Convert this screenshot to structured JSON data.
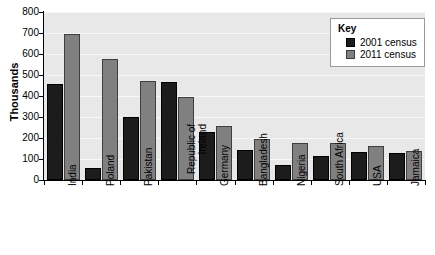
{
  "chart_data": {
    "type": "bar",
    "title": "",
    "xlabel": "",
    "ylabel": "Thousands",
    "ylim": [
      0,
      800
    ],
    "yticks": [
      0,
      100,
      200,
      300,
      400,
      500,
      600,
      700,
      800
    ],
    "grid": true,
    "legend_position": "top-right",
    "legend_title": "Key",
    "categories": [
      "India",
      "Poland",
      "Pakistan",
      "Republic of Ireland",
      "Germany",
      "Bangladesh",
      "Nigeria",
      "South Africa",
      "USA",
      "Jamaica"
    ],
    "series": [
      {
        "name": "2001 census",
        "color": "#1c1c1c",
        "values": [
          455,
          55,
          300,
          465,
          230,
          145,
          70,
          115,
          135,
          130
        ]
      },
      {
        "name": "2011 census",
        "color": "#808080",
        "values": [
          693,
          575,
          470,
          395,
          255,
          195,
          175,
          175,
          160,
          140
        ]
      }
    ]
  },
  "colors": {
    "plot_background": "#e8e8e8",
    "gridline": "#f7f7f7",
    "axis": "#000000",
    "page_background": "#ffffff"
  }
}
